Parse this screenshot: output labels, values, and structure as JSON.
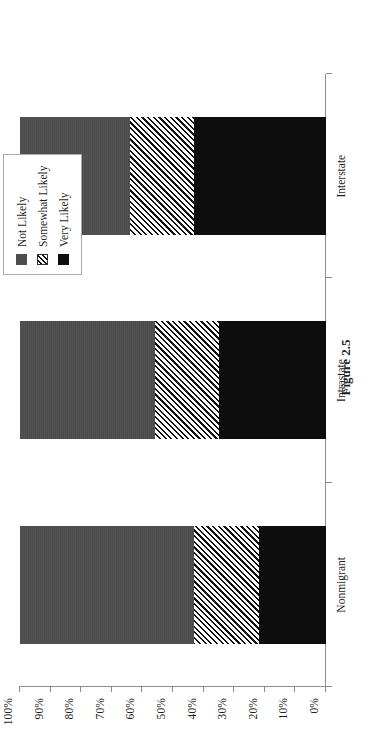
{
  "figure": {
    "caption": "Figure 2.5"
  },
  "legend": {
    "title": "",
    "items": [
      {
        "label": "Not Likely",
        "swatch": "solid-gray-swatch",
        "color": "#4d4d4d"
      },
      {
        "label": "Somewhat Likely",
        "swatch": "diagonal-hatch-swatch",
        "color": "#ffffff"
      },
      {
        "label": "Very Likely",
        "swatch": "solid-black-swatch",
        "color": "#0d0d0d"
      }
    ]
  },
  "axis": {
    "tick_labels": [
      "0%",
      "10%",
      "20%",
      "30%",
      "40%",
      "50%",
      "60%",
      "70%",
      "80%",
      "90%",
      "100%"
    ]
  },
  "chart_data": {
    "type": "bar",
    "subtype": "100% stacked column",
    "orientation": "vertical columns, page rotated 90 degrees counter-clockwise",
    "title": "",
    "xlabel": "",
    "ylabel": "",
    "ylim": [
      0,
      100
    ],
    "grid": false,
    "legend_position": "top right, boxed",
    "categories": [
      "Nonmigrant",
      "Intrastate",
      "Interstate"
    ],
    "series": [
      {
        "name": "Very Likely",
        "values": [
          22,
          35,
          43
        ]
      },
      {
        "name": "Somewhat Likely",
        "values": [
          21,
          21,
          21
        ]
      },
      {
        "name": "Not Likely",
        "values": [
          57,
          44,
          36
        ]
      }
    ],
    "stack_order_bottom_to_top": [
      "Very Likely",
      "Somewhat Likely",
      "Not Likely"
    ],
    "tick_values": [
      0,
      10,
      20,
      30,
      40,
      50,
      60,
      70,
      80,
      90,
      100
    ],
    "tick_labels": [
      "0%",
      "10%",
      "20%",
      "30%",
      "40%",
      "50%",
      "60%",
      "70%",
      "80%",
      "90%",
      "100%"
    ]
  }
}
